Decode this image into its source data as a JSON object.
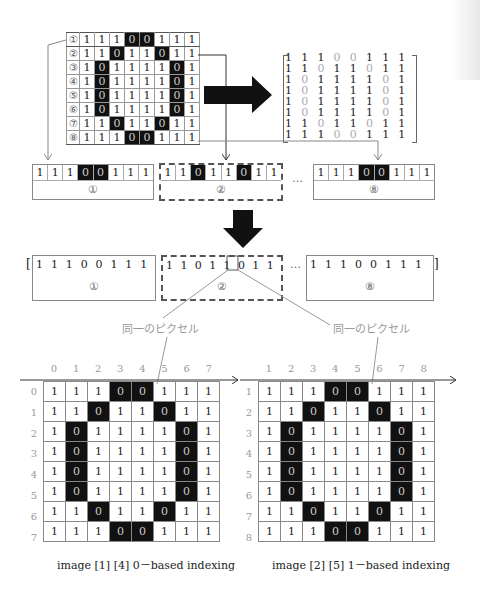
{
  "image_grid": {
    "row_labels": [
      "①",
      "②",
      "③",
      "④",
      "⑤",
      "⑥",
      "⑦",
      "⑧"
    ],
    "rows": [
      [
        1,
        1,
        1,
        0,
        0,
        1,
        1,
        1
      ],
      [
        1,
        1,
        0,
        1,
        1,
        0,
        1,
        1
      ],
      [
        1,
        0,
        1,
        1,
        1,
        1,
        0,
        1
      ],
      [
        1,
        0,
        1,
        1,
        1,
        1,
        0,
        1
      ],
      [
        1,
        0,
        1,
        1,
        1,
        1,
        0,
        1
      ],
      [
        1,
        0,
        1,
        1,
        1,
        1,
        0,
        1
      ],
      [
        1,
        1,
        0,
        1,
        1,
        0,
        1,
        1
      ],
      [
        1,
        1,
        1,
        0,
        0,
        1,
        1,
        1
      ]
    ]
  },
  "strips": {
    "first": {
      "values": [
        1,
        1,
        1,
        0,
        0,
        1,
        1,
        1
      ],
      "label": "①"
    },
    "second": {
      "values": [
        1,
        1,
        0,
        1,
        1,
        0,
        1,
        1
      ],
      "label": "②"
    },
    "last": {
      "values": [
        1,
        1,
        1,
        0,
        0,
        1,
        1,
        1
      ],
      "label": "⑧"
    },
    "ellipsis": "…"
  },
  "flattened": {
    "open_bracket": "[",
    "close_bracket": "]",
    "first": {
      "values": [
        1,
        1,
        1,
        0,
        0,
        1,
        1,
        1
      ],
      "label": "①"
    },
    "second": {
      "values": [
        1,
        1,
        0,
        1,
        1,
        0,
        1,
        1
      ],
      "label": "②",
      "highlight_index": 4
    },
    "last": {
      "values": [
        1,
        1,
        1,
        0,
        0,
        1,
        1,
        1
      ],
      "label": "⑧"
    },
    "ellipsis": "…"
  },
  "captions": {
    "same_pixel_left": "同一のピクセル",
    "same_pixel_right": "同一のピクセル"
  },
  "zero_based": {
    "col_labels": [
      "0",
      "1",
      "2",
      "3",
      "4",
      "5",
      "6",
      "7"
    ],
    "row_labels": [
      "0",
      "1",
      "2",
      "3",
      "4",
      "5",
      "6",
      "7"
    ],
    "caption": "image [1] [4] 0－based indexing"
  },
  "one_based": {
    "col_labels": [
      "1",
      "2",
      "3",
      "4",
      "5",
      "6",
      "7",
      "8"
    ],
    "row_labels": [
      "1",
      "2",
      "3",
      "4",
      "5",
      "6",
      "7",
      "8"
    ],
    "caption": "image [2] [5] 1－based indexing"
  }
}
